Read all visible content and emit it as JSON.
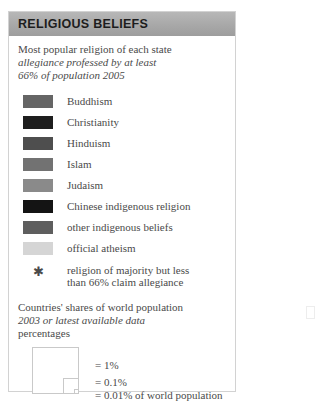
{
  "panel": {
    "header_title": "RELIGIOUS BELIEFS",
    "intro": {
      "line1": "Most popular religion of each state",
      "line2": "allegiance professed by at least",
      "line3": "66% of population 2005"
    },
    "legend_items": [
      {
        "label": "Buddhism",
        "color": "#656565"
      },
      {
        "label": "Christianity",
        "color": "#1e1e1e"
      },
      {
        "label": "Hinduism",
        "color": "#4e4e4e"
      },
      {
        "label": "Islam",
        "color": "#727272"
      },
      {
        "label": "Judaism",
        "color": "#8a8a8a"
      },
      {
        "label": "Chinese indigenous religion",
        "color": "#141414"
      },
      {
        "label": "other indigenous beliefs",
        "color": "#5e5e5e"
      },
      {
        "label": "official atheism",
        "color": "#d5d5d5"
      }
    ],
    "note": {
      "symbol": "✱",
      "line1": "religion of majority but less",
      "line2": "than 66% claim allegiance"
    },
    "shares": {
      "line1": "Countries' shares of world population",
      "line2": "2003 or latest available data",
      "line3": "percentages"
    },
    "squares": {
      "label_1pct": "= 1%",
      "label_01pct": "= 0.1%",
      "label_001pct": "= 0.01% of world population"
    }
  }
}
